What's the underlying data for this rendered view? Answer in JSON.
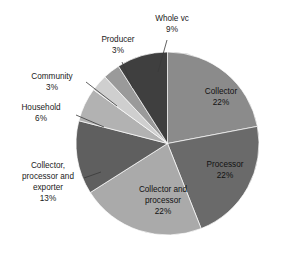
{
  "chart_data": {
    "type": "pie",
    "title": "",
    "subtitle": "",
    "xlabel": "",
    "ylabel": "",
    "legend_position": "none",
    "grid": false,
    "value_unit": "percent",
    "start_angle_deg": 0,
    "direction": "clockwise",
    "categories": [
      "Collector",
      "Processor",
      "Collector and processor",
      "Collector, processor and exporter",
      "Household",
      "Community",
      "Producer",
      "Whole vc"
    ],
    "values": [
      22,
      22,
      22,
      13,
      6,
      3,
      3,
      9
    ],
    "slices": [
      {
        "label": "Collector",
        "value": 22,
        "value_text": "22%",
        "color": "#8b8b8b",
        "label_placement": "inside",
        "label_lines": [
          "Collector",
          "22%"
        ]
      },
      {
        "label": "Processor",
        "value": 22,
        "value_text": "22%",
        "color": "#6a6a6a",
        "label_placement": "inside",
        "label_lines": [
          "Processor",
          "22%"
        ]
      },
      {
        "label": "Collector and processor",
        "value": 22,
        "value_text": "22%",
        "color": "#aaaaaa",
        "label_placement": "inside",
        "label_lines": [
          "Collector and",
          "processor",
          "22%"
        ]
      },
      {
        "label": "Collector, processor and exporter",
        "value": 13,
        "value_text": "13%",
        "color": "#5f5f5f",
        "label_placement": "outside-left",
        "label_lines": [
          "Collector,",
          "processor and",
          "exporter",
          "13%"
        ]
      },
      {
        "label": "Household",
        "value": 6,
        "value_text": "6%",
        "color": "#b2b2b2",
        "label_placement": "outside-left",
        "label_lines": [
          "Household",
          "6%"
        ]
      },
      {
        "label": "Community",
        "value": 3,
        "value_text": "3%",
        "color": "#cfcfcf",
        "label_placement": "outside-left",
        "label_lines": [
          "Community",
          "3%"
        ]
      },
      {
        "label": "Producer",
        "value": 3,
        "value_text": "3%",
        "color": "#9a9a9a",
        "label_placement": "outside-top",
        "label_lines": [
          "Producer",
          "3%"
        ]
      },
      {
        "label": "Whole vc",
        "value": 9,
        "value_text": "9%",
        "color": "#3f3f3f",
        "label_placement": "outside-top",
        "label_lines": [
          "Whole vc",
          "9%"
        ]
      }
    ]
  },
  "labels": {
    "collector_name": "Collector",
    "collector_pct": "22%",
    "processor_name": "Processor",
    "processor_pct": "22%",
    "collproc_l1": "Collector and",
    "collproc_l2": "processor",
    "collproc_pct": "22%",
    "cpe_l1": "Collector,",
    "cpe_l2": "processor and",
    "cpe_l3": "exporter",
    "cpe_pct": "13%",
    "household_name": "Household",
    "household_pct": "6%",
    "community_name": "Community",
    "community_pct": "3%",
    "producer_name": "Producer",
    "producer_pct": "3%",
    "wholevc_name": "Whole vc",
    "wholevc_pct": "9%"
  }
}
